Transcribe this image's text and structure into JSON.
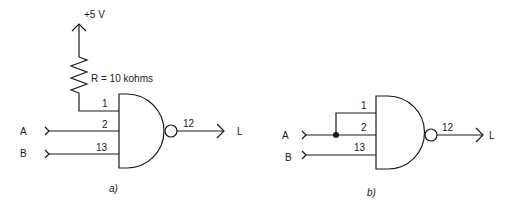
{
  "figure_a": {
    "caption": "a)",
    "supply_label": "+5 V",
    "resistor_label": "R = 10 kohms",
    "inputs": [
      {
        "name": "A",
        "pin": "2"
      },
      {
        "name": "B",
        "pin": "13"
      }
    ],
    "pullup_pin": "1",
    "output": {
      "pin": "12",
      "name": "L"
    },
    "gate": "NAND"
  },
  "figure_b": {
    "caption": "b)",
    "inputs": [
      {
        "name": "A",
        "pins": [
          "1",
          "2"
        ]
      },
      {
        "name": "B",
        "pin": "13"
      }
    ],
    "output": {
      "pin": "12",
      "name": "L"
    },
    "gate": "NAND"
  },
  "colors": {
    "ink": "#1a1a1a",
    "background": "#ffffff"
  }
}
